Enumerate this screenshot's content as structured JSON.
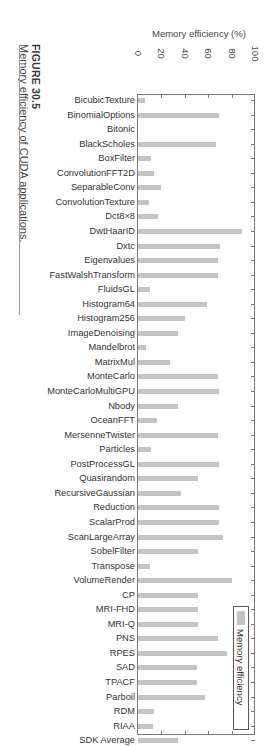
{
  "caption": {
    "figure_number": "FIGURE 30.5",
    "title": "Memory efficiency of CUDA applications."
  },
  "chart_data": {
    "type": "bar",
    "orientation": "horizontal",
    "title": "",
    "xlabel": "",
    "ylabel": "Memory efficiency (%)",
    "ylim": [
      0,
      100
    ],
    "ticks": [
      "0",
      "20",
      "40",
      "60",
      "80",
      "100"
    ],
    "legend": [
      "Memory efficiency"
    ],
    "legend_position": "lower right",
    "grid": false,
    "categories": [
      "BicubicTexture",
      "BinomialOptions",
      "Bitonic",
      "BlackScholes",
      "BoxFilter",
      "ConvolutionFFT2D",
      "SeparableConv",
      "ConvolutionTexture",
      "Dct8×8",
      "DwtHaarID",
      "Dxtc",
      "Eigenvalues",
      "FastWalshTransform",
      "FluidsGL",
      "Histogram64",
      "Histogram256",
      "ImageDenoising",
      "Mandelbrot",
      "MatrixMul",
      "MonteCarlo",
      "MonteCarloMultiGPU",
      "Nbody",
      "OceanFFT",
      "MersenneTwister",
      "Particles",
      "PostProcessGL",
      "Quasirandom",
      "RecursiveGaussian",
      "Reduction",
      "ScalarProd",
      "ScanLargeArray",
      "SobelFilter",
      "Transpose",
      "VolumeRender",
      "CP",
      "MRI-FHD",
      "MRI-Q",
      "PNS",
      "RPES",
      "SAD",
      "TPACF",
      "Parboil",
      "RDM",
      "RIAA",
      "SDK Average"
    ],
    "series": [
      {
        "name": "Memory efficiency",
        "values": [
          6,
          69,
          0,
          67,
          11,
          14,
          20,
          9,
          17,
          89,
          70,
          68,
          68,
          10,
          59,
          40,
          34,
          7,
          27,
          68,
          69,
          34,
          16,
          68,
          11,
          69,
          51,
          37,
          69,
          69,
          73,
          51,
          10,
          80,
          51,
          51,
          51,
          68,
          76,
          50,
          50,
          57,
          14,
          13,
          34
        ]
      }
    ],
    "colors": {
      "bar": "#c4c4c4",
      "axis": "#777777"
    }
  }
}
